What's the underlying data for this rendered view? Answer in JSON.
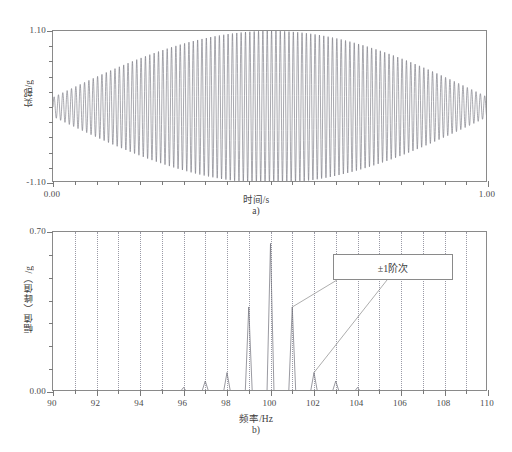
{
  "figure": {
    "panels": [
      {
        "caption": "a)",
        "xlabel": "时间/s",
        "ylabel": "实部/g",
        "xticklabels": [
          "0.00",
          "1.00"
        ],
        "yticklabels": [
          "1.10",
          "-1.10"
        ]
      },
      {
        "caption": "b)",
        "xlabel": "频率/Hz",
        "ylabel": "幅值（峰值）/g",
        "xticklabels": [
          "90",
          "92",
          "94",
          "96",
          "98",
          "100",
          "102",
          "104",
          "106",
          "108",
          "110"
        ],
        "yticklabels": [
          "0.70",
          "0.00"
        ],
        "annotation": "±1阶次"
      }
    ]
  },
  "colors": {
    "trace": "#6e6e78",
    "axis": "#8a8a8a",
    "grid": "#9a9aa6",
    "text": "#3d3d3d"
  },
  "chart_data": [
    {
      "type": "line",
      "title": "",
      "xlabel": "时间/s",
      "ylabel": "实部/g",
      "xlim": [
        0.0,
        1.0
      ],
      "ylim": [
        -1.1,
        1.1
      ],
      "xticks": [
        0.0,
        1.0
      ],
      "yticks": [
        -1.1,
        1.1
      ],
      "grid": false,
      "description": "Amplitude-modulated beat waveform: carrier at 100 Hz modulated by a slow envelope peaking at t=0.5 s",
      "model": {
        "carrier_hz": 100,
        "envelope_hz": 1,
        "envelope_min": 0.14,
        "envelope_max": 1.1,
        "samples": 4000
      }
    },
    {
      "type": "bar",
      "title": "",
      "xlabel": "频率/Hz",
      "ylabel": "幅值（峰值）/g",
      "xlim": [
        90,
        110
      ],
      "ylim": [
        0.0,
        0.7
      ],
      "xticks": [
        90,
        92,
        94,
        96,
        98,
        100,
        102,
        104,
        106,
        108,
        110
      ],
      "yticks": [
        0.0,
        0.7
      ],
      "grid": "vertical-dotted-every-1Hz",
      "categories": [
        90,
        91,
        92,
        93,
        94,
        95,
        96,
        97,
        98,
        99,
        100,
        101,
        102,
        103,
        104,
        105,
        106,
        107,
        108,
        109,
        110
      ],
      "values": [
        0.0,
        0.0,
        0.0,
        0.0,
        0.004,
        0.01,
        0.02,
        0.048,
        0.085,
        0.372,
        0.65,
        0.372,
        0.085,
        0.048,
        0.02,
        0.01,
        0.004,
        0.0,
        0.0,
        0.0,
        0.0
      ],
      "annotations": [
        {
          "text": "±1阶次",
          "points_to": [
            101,
            102
          ]
        }
      ]
    }
  ]
}
